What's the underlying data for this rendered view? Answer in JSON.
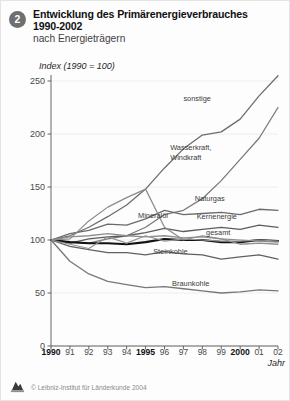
{
  "header": {
    "badge": "2",
    "title_line1": "Entwicklung des Primärenergieverbrauches",
    "title_line2": "1990-2002",
    "subtitle": "nach Energieträgern"
  },
  "footer": {
    "copyright": "© Leibniz-Institut für Länderkunde 2004",
    "logo_icon": "institute-logo-icon"
  },
  "axis": {
    "y_unit_label": "Index (1990 = 100)",
    "x_axis_label": "Jahr",
    "y_ticks": [
      "0",
      "50",
      "100",
      "150",
      "200",
      "250"
    ],
    "x_ticks": [
      {
        "label": "1990",
        "bold": true
      },
      {
        "label": "91",
        "bold": false
      },
      {
        "label": "92",
        "bold": false
      },
      {
        "label": "93",
        "bold": false
      },
      {
        "label": "94",
        "bold": false
      },
      {
        "label": "1995",
        "bold": true
      },
      {
        "label": "96",
        "bold": false
      },
      {
        "label": "97",
        "bold": false
      },
      {
        "label": "98",
        "bold": false
      },
      {
        "label": "99",
        "bold": false
      },
      {
        "label": "2000",
        "bold": true
      },
      {
        "label": "01",
        "bold": false
      },
      {
        "label": "02",
        "bold": false
      }
    ]
  },
  "chart_data": {
    "type": "line",
    "title": "Entwicklung des Primärenergieverbrauches 1990-2002 nach Energieträgern",
    "xlabel": "Jahr",
    "ylabel": "Index (1990 = 100)",
    "x": [
      1990,
      1991,
      1992,
      1993,
      1994,
      1995,
      1996,
      1997,
      1998,
      1999,
      2000,
      2001,
      2002
    ],
    "xlim": [
      1990,
      2002
    ],
    "ylim": [
      0,
      250
    ],
    "y_ticks": [
      0,
      50,
      100,
      150,
      200,
      250
    ],
    "grid": true,
    "legend": "inline-labels",
    "series": [
      {
        "name": "sonstige",
        "color": "#6d6d6d",
        "width": 1.3,
        "values": [
          100,
          104,
          112,
          122,
          133,
          148,
          168,
          186,
          199,
          202,
          214,
          236,
          255
        ]
      },
      {
        "name": "Wasserkraft, Windkraft",
        "color": "#7a7a7a",
        "width": 1.3,
        "values": [
          100,
          98,
          97,
          101,
          104,
          112,
          124,
          128,
          139,
          156,
          176,
          196,
          225
        ]
      },
      {
        "name": "Naturgas",
        "color": "#6a6a6a",
        "width": 1.3,
        "values": [
          100,
          106,
          109,
          115,
          114,
          120,
          128,
          124,
          125,
          126,
          124,
          129,
          128
        ]
      },
      {
        "name": "Kernenergie",
        "color": "#5c5c5c",
        "width": 1.3,
        "values": [
          100,
          97,
          101,
          103,
          104,
          107,
          111,
          108,
          110,
          112,
          110,
          114,
          112
        ]
      },
      {
        "name": "gesamt",
        "color": "#111111",
        "width": 2.1,
        "values": [
          100,
          98,
          97,
          97,
          96,
          98,
          101,
          100,
          100,
          98,
          98,
          100,
          99
        ]
      },
      {
        "name": "Mineralöl",
        "color": "#8f8f8f",
        "width": 1.3,
        "values": [
          100,
          103,
          104,
          106,
          104,
          103,
          104,
          102,
          103,
          101,
          96,
          97,
          96
        ]
      },
      {
        "name": "Steinkohle",
        "color": "#606060",
        "width": 1.3,
        "values": [
          100,
          94,
          91,
          88,
          88,
          86,
          89,
          87,
          86,
          82,
          84,
          86,
          82
        ]
      },
      {
        "name": "Braunkohle",
        "color": "#777777",
        "width": 1.3,
        "values": [
          100,
          80,
          68,
          61,
          58,
          55,
          56,
          54,
          52,
          50,
          51,
          53,
          52
        ]
      },
      {
        "name": "spitze",
        "color": "#8a8a8a",
        "width": 1.2,
        "values": [
          100,
          101,
          118,
          131,
          140,
          148,
          112,
          100,
          104,
          101,
          100,
          99,
          98
        ]
      },
      {
        "name": "spitze2",
        "color": "#949494",
        "width": 1.2,
        "values": [
          100,
          96,
          92,
          103,
          97,
          104,
          99,
          101,
          100,
          99,
          99,
          100,
          99
        ]
      }
    ],
    "annotations": [
      {
        "text": "sonstige",
        "x": 1997,
        "y": 232
      },
      {
        "text": "Wasserkraft,",
        "x": 1996.3,
        "y": 186
      },
      {
        "text": "Windkraft",
        "x": 1996.3,
        "y": 176
      },
      {
        "text": "Naturgas",
        "x": 1997.6,
        "y": 138
      },
      {
        "text": "Mineralöl",
        "x": 1994.6,
        "y": 122
      },
      {
        "text": "Kernenergie",
        "x": 1997.7,
        "y": 121
      },
      {
        "text": "gesamt",
        "x": 1998.2,
        "y": 106
      },
      {
        "text": "Steinkohle",
        "x": 1995.4,
        "y": 88
      },
      {
        "text": "Braunkohle",
        "x": 1996.4,
        "y": 58
      }
    ]
  }
}
